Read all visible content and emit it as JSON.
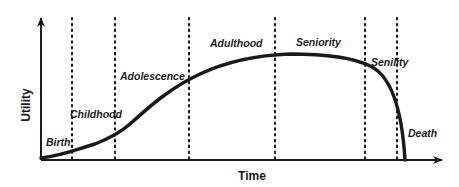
{
  "diagram": {
    "x_axis_label": "Time",
    "y_axis_label": "Utility",
    "stages": [
      {
        "label": "Birth",
        "x": 46,
        "y": 146
      },
      {
        "label": "Childhood",
        "x": 70,
        "y": 118
      },
      {
        "label": "Adolescence",
        "x": 120,
        "y": 80
      },
      {
        "label": "Adulthood",
        "x": 210,
        "y": 47
      },
      {
        "label": "Seniority",
        "x": 296,
        "y": 46
      },
      {
        "label": "Senility",
        "x": 371,
        "y": 66
      },
      {
        "label": "Death",
        "x": 408,
        "y": 137
      }
    ],
    "divider_x": [
      72,
      115,
      189,
      275,
      365,
      397
    ],
    "colors": {
      "ink": "#1a1a1a",
      "background": "#ffffff"
    }
  }
}
